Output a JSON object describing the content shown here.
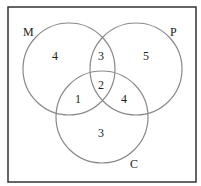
{
  "diagram": {
    "type": "venn",
    "sets": {
      "M": {
        "label": "M"
      },
      "P": {
        "label": "P"
      },
      "C": {
        "label": "C"
      }
    },
    "regions": {
      "M_only": "4",
      "P_only": "5",
      "C_only": "3",
      "M_P_only": "3",
      "M_C_only": "1",
      "P_C_only": "4",
      "M_P_C": "2"
    },
    "colors": {
      "stroke": "#8a8a8a",
      "border": "#333333",
      "text": "#222222"
    }
  }
}
